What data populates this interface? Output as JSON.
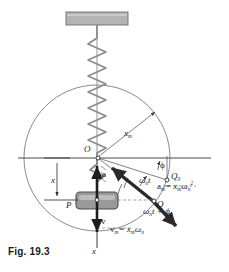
{
  "figure": {
    "caption": "Fig. 19.3"
  },
  "colors": {
    "ink": "#1d1d1d",
    "thin_line": "#555555",
    "circle": "#6b6b6b",
    "spring": "#8a8a8a",
    "support_fill": "#b4b4b4",
    "support_stroke": "#6e6e6e",
    "block_fill": "#9a9a9a",
    "block_stroke": "#4a4a4a",
    "heavy_vector": "#2a2a2a",
    "dashed": "#777777"
  },
  "labels": {
    "origin": "O",
    "point_p": "P",
    "point_q": "Q",
    "point_q0": "Q",
    "point_q0_sub": "0",
    "amplitude": "x",
    "amplitude_sub": "m",
    "displacement": "x",
    "axis_x": "x",
    "accel_vector": "a",
    "vel_vector": "v",
    "phase_angle": "ϕ",
    "omega_t": "ω",
    "omega_t_sub": "n",
    "omega_t_var": "t",
    "omega_t_phase": "ω",
    "omega_t_phase_sub": "n",
    "omega_t_phase_rest": "t + ϕ",
    "accel_eq_lhs": "a",
    "accel_eq_lhs_sub": "m",
    "accel_eq_rhs": "= x",
    "accel_eq_rhs_sub": "m",
    "accel_eq_omega": "ω",
    "accel_eq_omega_sub": "n",
    "accel_eq_omega_sup": "2",
    "vel_eq_lhs": "v",
    "vel_eq_lhs_sub": "m",
    "vel_eq_rhs": "= x",
    "vel_eq_rhs_sub": "m",
    "vel_eq_omega": "ω",
    "vel_eq_omega_sub": "n"
  },
  "geometry": {
    "origin_x": 97,
    "origin_y": 158,
    "radius": 73,
    "q_x": 155,
    "q_y": 200,
    "q0_x": 170,
    "q0_y": 180,
    "block_x": 97,
    "block_y": 200
  }
}
